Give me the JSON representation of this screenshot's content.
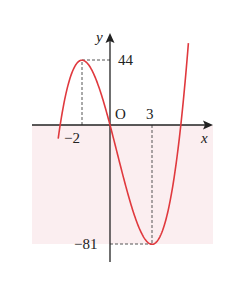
{
  "chart_data": {
    "type": "line",
    "title": "",
    "function": "f(x) = 2x^3 - 3x^2 - 36x",
    "xlabel": "x",
    "ylabel": "y",
    "origin_label": "O",
    "x_tick_labels": [
      "-2",
      "3"
    ],
    "y_tick_labels": [
      "44",
      "-81"
    ],
    "key_points": [
      {
        "x": -2,
        "y": 44,
        "kind": "local maximum"
      },
      {
        "x": 3,
        "y": -81,
        "kind": "local minimum"
      },
      {
        "x": 0,
        "y": 0,
        "kind": "origin"
      }
    ],
    "series": [
      {
        "name": "y = f(x)",
        "color": "#e0393e",
        "x": [
          -3.7,
          -3,
          -2.5,
          -2,
          -1.5,
          -1,
          0,
          1,
          2,
          3,
          4,
          5,
          5.6
        ],
        "y": [
          -27.2,
          27,
          40,
          44,
          40.5,
          31,
          0,
          -37,
          -68,
          -81,
          -64,
          -5,
          54.3
        ]
      }
    ],
    "guides": [
      {
        "from": [
          -2,
          0
        ],
        "to": [
          -2,
          44
        ],
        "style": "dashed"
      },
      {
        "from": [
          -2,
          44
        ],
        "to": [
          0,
          44
        ],
        "style": "dashed"
      },
      {
        "from": [
          3,
          0
        ],
        "to": [
          3,
          -81
        ],
        "style": "dashed"
      },
      {
        "from": [
          0,
          -81
        ],
        "to": [
          3,
          -81
        ],
        "style": "dashed"
      }
    ],
    "shaded_region": {
      "y_range": [
        -81,
        0
      ],
      "color": "#fbeef0"
    },
    "grid": false,
    "legend": null
  },
  "labels": {
    "x_axis": "x",
    "y_axis": "y",
    "origin": "O",
    "tick_neg2": "−2",
    "tick_3": "3",
    "tick_44": "44",
    "tick_neg81": "−81"
  },
  "colors": {
    "curve": "#e0393e",
    "axes": "#222222",
    "shade": "#fbeef0",
    "guide": "#555555"
  }
}
